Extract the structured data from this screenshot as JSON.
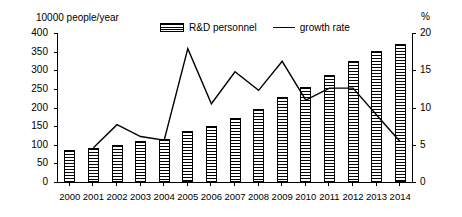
{
  "chart_data": {
    "type": "bar",
    "title": "",
    "xlabel": "",
    "ylabel": "10000 people/year",
    "y2label": "%",
    "ylim": [
      0,
      400
    ],
    "y2lim": [
      0,
      20
    ],
    "yticks": [
      0,
      50,
      100,
      150,
      200,
      250,
      300,
      350,
      400
    ],
    "y2ticks": [
      0,
      5,
      10,
      15,
      20
    ],
    "grid": false,
    "legend_position": "top-center",
    "categories": [
      "2000",
      "2001",
      "2002",
      "2003",
      "2004",
      "2005",
      "2006",
      "2007",
      "2008",
      "2009",
      "2010",
      "2011",
      "2012",
      "2013",
      "2014"
    ],
    "series": [
      {
        "name": "R&D personnel",
        "type": "bar",
        "axis": "left",
        "unit": "10000 people/year",
        "values": [
          85,
          90,
          100,
          110,
          115,
          136,
          150,
          173,
          197,
          229,
          255,
          288,
          325,
          353,
          371
        ]
      },
      {
        "name": "growth rate",
        "type": "line",
        "axis": "right",
        "unit": "%",
        "values": [
          null,
          4.6,
          7.7,
          6.1,
          5.6,
          17.9,
          10.5,
          14.8,
          12.3,
          16.2,
          11.0,
          12.6,
          12.6,
          9.0,
          5.4
        ]
      }
    ]
  },
  "legend": {
    "bar_label": "R&D personnel",
    "line_label": "growth rate"
  },
  "colors": {
    "axis": "#000000",
    "bar_fill": "#000000",
    "line": "#000000",
    "background": "#ffffff"
  }
}
